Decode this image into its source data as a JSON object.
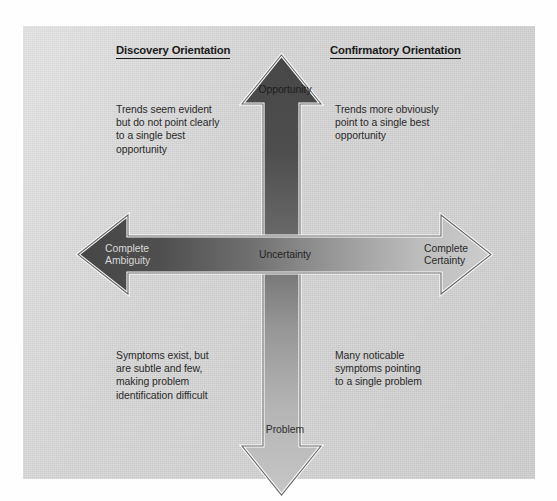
{
  "figure": {
    "panel_color": "#cfcfcf",
    "page_color": "#ffffff"
  },
  "headings": {
    "left": "Discovery Orientation",
    "right": "Confirmatory Orientation"
  },
  "axes": {
    "vertical": {
      "top_label": "Opportunity",
      "bottom_label": "Problem",
      "gradient_from": "#4a4a4a",
      "gradient_to": "#c2c2c2"
    },
    "horizontal": {
      "left_label": "Complete\nAmbiguity",
      "right_label": "Complete\nCertainty",
      "center_label": "Uncertainty",
      "gradient_from": "#4a4a4a",
      "gradient_to": "#c9c9c9"
    }
  },
  "quadrants": {
    "top_left": "Trends seem evident\nbut do not point clearly\nto a single best\nopportunity",
    "top_right": "Trends more obviously\npoint to a single best\nopportunity",
    "bottom_left": "Symptoms exist, but\nare subtle and few,\nmaking problem\nidentification difficult",
    "bottom_right": "Many noticable\nsymptoms pointing\nto a single problem"
  }
}
